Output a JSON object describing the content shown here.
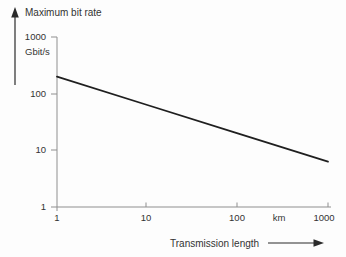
{
  "window": {
    "background": "#fdfdfd"
  },
  "colors": {
    "background": "#fdfdfd",
    "axis": "#8f8f8f",
    "line": "#1f1f1f",
    "text": "#333333",
    "arrow": "#2a2a2a"
  },
  "chart_data": {
    "type": "line",
    "title": "",
    "x_scale": "log",
    "y_scale": "log",
    "x": [
      1,
      10,
      100,
      1000
    ],
    "series": [
      {
        "name": "Maximum bit rate",
        "values": [
          200,
          63,
          20,
          6.3
        ]
      }
    ],
    "xlabel": "Transmission length",
    "x_unit": "km",
    "ylabel": "Maximum bit rate",
    "y_unit": "Gbit/s",
    "xlim": [
      1,
      1000
    ],
    "ylim": [
      1,
      1000
    ],
    "x_tick_labels": [
      "1",
      "10",
      "100",
      "1000"
    ],
    "y_tick_labels": [
      "1",
      "10",
      "100",
      "1000"
    ],
    "grid": false,
    "legend": "none"
  }
}
